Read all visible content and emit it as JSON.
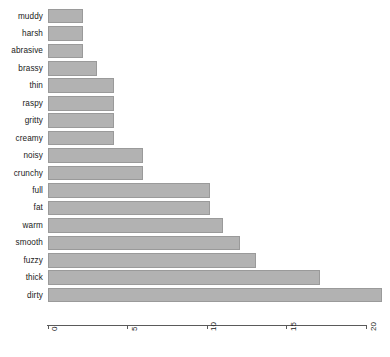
{
  "chart_data": {
    "type": "bar",
    "orientation": "horizontal",
    "title": "",
    "xlabel": "",
    "ylabel": "",
    "xlim": [
      0,
      21
    ],
    "grid": false,
    "legend": false,
    "bar_color": "#b2b2b2",
    "bar_edge_color": "#9a9a9a",
    "axis_color": "#5a5a5a",
    "xticks": [
      {
        "label": "0",
        "value": 0
      },
      {
        "label": "5",
        "value": 5
      },
      {
        "label": "10",
        "value": 10
      },
      {
        "label": "15",
        "value": 15
      },
      {
        "label": "20",
        "value": 20
      }
    ],
    "categories": [
      "muddy",
      "harsh",
      "abrasive",
      "brassy",
      "thin",
      "raspy",
      "gritty",
      "creamy",
      "noisy",
      "crunchy",
      "full",
      "fat",
      "warm",
      "smooth",
      "fuzzy",
      "thick",
      "dirty"
    ],
    "values": [
      2.2,
      2.2,
      2.2,
      3.1,
      4.2,
      4.2,
      4.2,
      4.2,
      6,
      6,
      10.2,
      10.2,
      11,
      12.1,
      13.1,
      17.1,
      21
    ]
  }
}
